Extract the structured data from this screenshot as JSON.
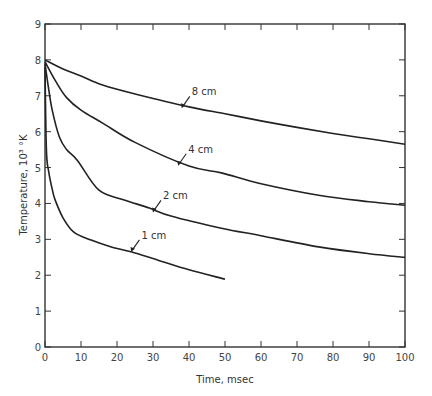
{
  "chart_data": {
    "type": "line",
    "title": "",
    "xlabel": "Time, msec",
    "ylabel": "Temperature, 10³ °K",
    "xlim": [
      0,
      100
    ],
    "ylim": [
      0,
      9
    ],
    "x_ticks": [
      0,
      10,
      20,
      30,
      40,
      50,
      60,
      70,
      80,
      90,
      100
    ],
    "y_ticks": [
      0,
      1,
      2,
      3,
      4,
      5,
      6,
      7,
      8,
      9
    ],
    "grid": false,
    "legend": "inline arrow labels on curves",
    "series": [
      {
        "name": "8 cm",
        "x": [
          0,
          5,
          10,
          16,
          25,
          40,
          50,
          60,
          70,
          80,
          90,
          100
        ],
        "y": [
          8.0,
          7.75,
          7.55,
          7.3,
          7.05,
          6.69,
          6.5,
          6.3,
          6.12,
          5.95,
          5.8,
          5.65
        ],
        "label_at": {
          "x": 38,
          "y": 6.65,
          "text": "8 cm"
        }
      },
      {
        "name": "4 cm",
        "x": [
          0,
          3,
          6,
          10,
          16,
          25,
          40,
          49,
          60,
          76,
          90,
          100
        ],
        "y": [
          7.95,
          7.4,
          6.95,
          6.6,
          6.24,
          5.7,
          5.04,
          4.85,
          4.55,
          4.23,
          4.05,
          3.95
        ],
        "label_at": {
          "x": 37,
          "y": 5.05,
          "text": "4 cm"
        }
      },
      {
        "name": "2 cm",
        "x": [
          0,
          1,
          2,
          4,
          6,
          9,
          15,
          22,
          29,
          35,
          49,
          60,
          76,
          90,
          100
        ],
        "y": [
          7.9,
          7.2,
          6.6,
          5.85,
          5.5,
          5.2,
          4.37,
          4.1,
          3.87,
          3.65,
          3.31,
          3.1,
          2.79,
          2.6,
          2.5
        ],
        "label_at": {
          "x": 30,
          "y": 3.75,
          "text": "2 cm"
        }
      },
      {
        "name": "1 cm",
        "x": [
          0,
          0.4,
          1,
          2,
          2.8,
          5,
          8,
          12.8,
          18,
          25,
          32,
          40,
          50
        ],
        "y": [
          7.8,
          5.5,
          4.9,
          4.4,
          4.1,
          3.6,
          3.2,
          2.98,
          2.8,
          2.62,
          2.4,
          2.15,
          1.89
        ],
        "label_at": {
          "x": 24,
          "y": 2.65,
          "text": "1 cm"
        }
      }
    ]
  },
  "axes": {
    "xlabel": "Time, msec",
    "ylabel": "Temperature, 10³ °K"
  },
  "labels": {
    "c8": "8 cm",
    "c4": "4 cm",
    "c2": "2 cm",
    "c1": "1 cm"
  },
  "colors": {
    "line": "#222222",
    "axis": "#333333"
  }
}
